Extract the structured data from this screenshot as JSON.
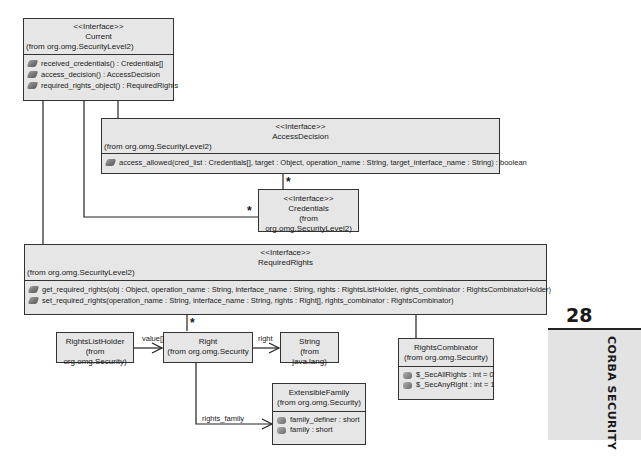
{
  "classes": {
    "current": {
      "stereotype": "<<Interface>>",
      "name": "Current",
      "from": "(from org.omg.SecurityLevel2)",
      "methods": [
        "received_credentials() : Credentials[]",
        "access_decision() : AccessDecision",
        "required_rights_object() : RequiredRights"
      ]
    },
    "access_decision": {
      "stereotype": "<<Interface>>",
      "name": "AccessDecision",
      "from": "(from org.omg.SecurityLevel2)",
      "methods": [
        "access_allowed(cred_list : Credentials[], target : Object, operation_name : String, target_interface_name : String) : boolean"
      ]
    },
    "credentials": {
      "stereotype": "<<Interface>>",
      "name": "Credentials",
      "from": "(from org.omg.SecurityLevel2)"
    },
    "required_rights": {
      "stereotype": "<<Interface>>",
      "name": "RequiredRights",
      "from": "(from org.omg.SecurityLevel2)",
      "methods": [
        "get_required_rights(obj : Object, operation_name : String, interface_name : String, rights : RightsListHolder, rights_combinator : RightsCombinatorHolder)",
        "set_required_rights(operation_name : String, interface_name : String, rights : Right[], rights_combinator : RightsCombinator)"
      ]
    },
    "rights_list_holder": {
      "name": "RightsListHolder",
      "from": "(from org.omg.Security)"
    },
    "right": {
      "name": "Right",
      "from": "(from org.omg.Security"
    },
    "string": {
      "name": "String",
      "from": "(from java.lang)"
    },
    "rights_combinator": {
      "name": "RightsCombinator",
      "from": "(from org.omg.Security)",
      "attributes": [
        "$_SecAllRights : int = 0",
        "$_SecAnyRight : int = 1"
      ]
    },
    "extensible_family": {
      "name": "ExtensibleFamily",
      "from": "(from org.omg.Security)",
      "attributes": [
        "family_definer : short",
        "family : short"
      ]
    }
  },
  "associations": {
    "multiplicity_many": "*",
    "value_label": "value[]",
    "right_label": "right",
    "rights_family_label": "rights_family"
  },
  "chapter_tab": {
    "number": "28",
    "title": "CORBA SECURITY"
  }
}
